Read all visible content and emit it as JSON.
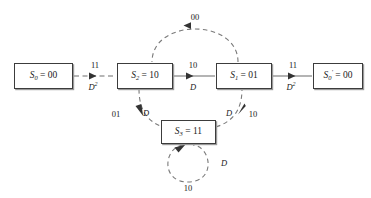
{
  "diagram": {
    "type": "state-transition-diagram",
    "title": "",
    "colors": {
      "node_border": "#3c3c3c",
      "node_shadow": "#9a9a9a",
      "edge_solid": "#555555",
      "edge_dashed": "#777777",
      "text": "#1a1a1a",
      "background": "#ffffff"
    },
    "nodes": [
      {
        "id": "S0",
        "name": "state-node-s0",
        "label": "S0 = 00",
        "symbol": "S",
        "subscript": "0",
        "prime": "",
        "value": "00",
        "x": 14,
        "y": 63,
        "width": 59,
        "height": 26
      },
      {
        "id": "S2",
        "name": "state-node-s2",
        "label": "S2 = 10",
        "symbol": "S",
        "subscript": "2",
        "prime": "",
        "value": "10",
        "x": 117,
        "y": 63,
        "width": 56,
        "height": 26
      },
      {
        "id": "S1",
        "name": "state-node-s1",
        "label": "S1 = 01",
        "symbol": "S",
        "subscript": "1",
        "prime": "",
        "value": "01",
        "x": 216,
        "y": 63,
        "width": 56,
        "height": 26
      },
      {
        "id": "S0prime",
        "name": "state-node-s0-prime",
        "label": "S0' = 00",
        "symbol": "S",
        "subscript": "0",
        "prime": "′",
        "value": "00",
        "x": 313,
        "y": 63,
        "width": 50,
        "height": 26
      },
      {
        "id": "S3",
        "name": "state-node-s3",
        "label": "S3 = 11",
        "symbol": "S",
        "subscript": "3",
        "prime": "",
        "value": "11",
        "x": 161,
        "y": 120,
        "width": 55,
        "height": 24
      }
    ],
    "edges": [
      {
        "id": "e-s0-s2",
        "name": "edge-s0-to-s2",
        "from": "S0",
        "to": "S2",
        "style": "dashed",
        "shape": "straight",
        "output_label": "11",
        "gain_label": "D",
        "gain_exponent": "2"
      },
      {
        "id": "e-s2-s1",
        "name": "edge-s2-to-s1",
        "from": "S2",
        "to": "S1",
        "style": "solid",
        "shape": "straight",
        "output_label": "10",
        "gain_label": "D",
        "gain_exponent": ""
      },
      {
        "id": "e-s1-s0prime",
        "name": "edge-s1-to-s0-prime",
        "from": "S1",
        "to": "S0prime",
        "style": "solid",
        "shape": "straight",
        "output_label": "11",
        "gain_label": "D",
        "gain_exponent": "2"
      },
      {
        "id": "e-s1-s2",
        "name": "edge-s1-to-s2-top-arc",
        "from": "S1",
        "to": "S2",
        "style": "dashed",
        "shape": "arc-top",
        "output_label": "00",
        "gain_label": "",
        "gain_exponent": ""
      },
      {
        "id": "e-s2-s3",
        "name": "edge-s2-to-s3-arc",
        "from": "S2",
        "to": "S3",
        "style": "dashed",
        "shape": "arc-lower-left",
        "output_label": "01",
        "gain_label": "D",
        "gain_exponent": ""
      },
      {
        "id": "e-s3-s1",
        "name": "edge-s3-to-s1-arc",
        "from": "S3",
        "to": "S1",
        "style": "dashed",
        "shape": "arc-lower-right",
        "output_label": "10",
        "gain_label": "D",
        "gain_exponent": ""
      },
      {
        "id": "e-s3-s3",
        "name": "edge-s3-self-loop",
        "from": "S3",
        "to": "S3",
        "style": "dashed",
        "shape": "self-loop",
        "output_label": "10",
        "gain_label": "D",
        "gain_exponent": ""
      }
    ],
    "labels": {
      "top_arc_output": "00",
      "left_edge_output": "11",
      "left_edge_gain_base": "D",
      "left_edge_gain_exp": "2",
      "mid_edge_output": "10",
      "mid_edge_gain": "D",
      "right_edge_output": "11",
      "right_edge_gain_base": "D",
      "right_edge_gain_exp": "2",
      "lower_left_output": "01",
      "lower_left_gain": "D",
      "lower_right_output": "10",
      "lower_right_gain": "D",
      "self_loop_output": "10",
      "self_loop_gain": "D"
    }
  }
}
